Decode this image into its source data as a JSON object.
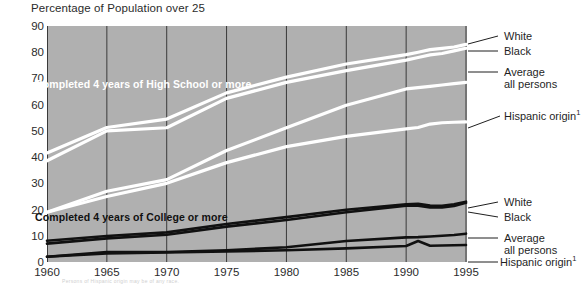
{
  "chart_data": {
    "type": "line",
    "title": "Percentage of Population over 25",
    "xlabel": "",
    "ylabel": "",
    "xlim": [
      1960,
      1995
    ],
    "ylim": [
      0,
      90
    ],
    "ytick_step": 10,
    "grid": "vertical gridlines at each 5-year tick; plot background shaded gray",
    "legend_position": "right, line-callout labels",
    "x": [
      1960,
      1965,
      1970,
      1975,
      1980,
      1985,
      1990,
      1991,
      1992,
      1993,
      1994,
      1995
    ],
    "categories": [
      "1960",
      "1965",
      "1970",
      "1975",
      "1980",
      "1985",
      "1990",
      "1995"
    ],
    "groups": [
      {
        "name": "Completed 4 years of High School or more",
        "color": "#ffffff",
        "series": [
          {
            "name": "White",
            "values": [
              41.6,
              51.3,
              54.5,
              64.5,
              70.5,
              75.5,
              79.1,
              80.0,
              81.0,
              81.5,
              82.0,
              83.0
            ]
          },
          {
            "name": "Black",
            "values": [
              38.6,
              50.0,
              51.2,
              62.4,
              68.5,
              73.0,
              77.0,
              78.0,
              79.0,
              79.5,
              80.5,
              81.5
            ]
          },
          {
            "name": "Average all persons",
            "values": [
              19.0,
              27.0,
              31.4,
              42.5,
              51.2,
              59.8,
              66.0,
              66.5,
              67.0,
              67.5,
              68.0,
              68.5
            ]
          },
          {
            "name": "Hispanic origin",
            "values": [
              19.0,
              25.0,
              30.0,
              37.9,
              44.0,
              47.9,
              50.8,
              51.3,
              52.6,
              53.1,
              53.3,
              53.4
            ]
          }
        ]
      },
      {
        "name": "Completed 4 years of College or more",
        "color": "#111111",
        "series": [
          {
            "name": "White",
            "values": [
              8.1,
              9.9,
              11.3,
              14.5,
              17.1,
              19.9,
              22.0,
              22.2,
              21.5,
              21.4,
              22.0,
              23.0
            ]
          },
          {
            "name": "Black",
            "values": [
              7.0,
              9.0,
              10.4,
              13.5,
              16.0,
              19.0,
              21.5,
              21.5,
              20.8,
              20.8,
              21.4,
              22.6
            ]
          },
          {
            "name": "Average all persons",
            "values": [
              2.0,
              3.8,
              3.8,
              4.5,
              5.6,
              8.0,
              9.4,
              9.5,
              9.7,
              10.0,
              10.3,
              10.8
            ]
          },
          {
            "name": "Hispanic origin",
            "values": [
              2.0,
              3.3,
              3.6,
              4.0,
              4.5,
              5.2,
              6.1,
              8.0,
              6.2,
              6.3,
              6.4,
              6.5
            ]
          }
        ]
      }
    ],
    "annotations": [
      {
        "text": "Completed 4 years of High School or more",
        "color": "#ffffff"
      },
      {
        "text": "Completed 4 years of College or more",
        "color": "#111111"
      }
    ]
  },
  "axes": {
    "y_ticks": [
      "90",
      "80",
      "70",
      "60",
      "50",
      "40",
      "30",
      "20",
      "10",
      "0"
    ],
    "x_ticks": [
      "1960",
      "1965",
      "1970",
      "1975",
      "1980",
      "1985",
      "1990",
      "1995"
    ]
  },
  "legend": {
    "upper": [
      {
        "label": "White"
      },
      {
        "label": "Black"
      },
      {
        "label": "Average",
        "label2": "all persons"
      },
      {
        "label": "Hispanic origin",
        "sup": "1"
      }
    ],
    "lower": [
      {
        "label": "White"
      },
      {
        "label": "Black"
      },
      {
        "label": "Average",
        "label2": "all persons"
      },
      {
        "label": "Hispanic origin",
        "sup": "1"
      }
    ]
  },
  "labels": {
    "title": "Percentage of Population over 25",
    "high_school_band": "Completed 4 years of High School or more",
    "college_band": "Completed 4 years of College or more"
  },
  "footnote": {
    "text": "Persons of Hispanic origin may be of any race."
  },
  "colors": {
    "plot_background": "#b0b0b0",
    "high_school_lines": "#ffffff",
    "college_lines": "#111111",
    "gridline": "#3a3a3a",
    "text": "#1f1f1f"
  }
}
